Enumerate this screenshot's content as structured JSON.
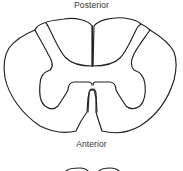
{
  "diagram": {
    "labels": {
      "top": "Posterior",
      "bottom": "Anterior"
    },
    "parts": [
      "outer-boundary (white matter)",
      "gray-matter butterfly",
      "posterior median septum",
      "anterior median fissure",
      "posterior horns",
      "anterior horns"
    ],
    "colors": {
      "stroke": "#222222",
      "background": "#ffffff",
      "text": "#333333"
    }
  }
}
